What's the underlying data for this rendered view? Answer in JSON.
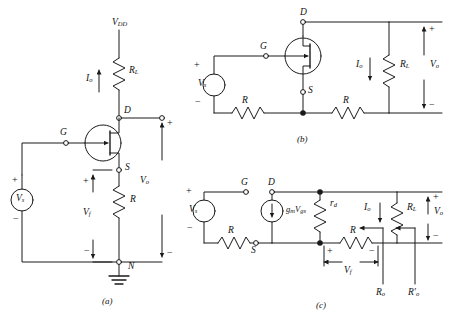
{
  "figure": {
    "background": "#ffffff",
    "stroke": "#1a1a1a",
    "panels": [
      {
        "key": "a",
        "label": "(a)",
        "caption": "common-drain amplifier with supply VDD"
      },
      {
        "key": "b",
        "label": "(b)",
        "caption": "redrawn circuit with load RL"
      },
      {
        "key": "c",
        "label": "(c)",
        "caption": "small-signal equivalent circuit"
      }
    ]
  },
  "panel_a": {
    "label": "(a)",
    "supply": "V",
    "supply_sub": "DD",
    "current": "I",
    "current_sub": "o",
    "load": "R",
    "load_sub": "L",
    "drain": "D",
    "gate": "G",
    "source": "S",
    "node": "N",
    "source_resistor": "R",
    "src_v": "V",
    "src_v_sub": "s",
    "vf": "V",
    "vf_sub": "f",
    "vo": "V",
    "vo_sub": "o",
    "plus": "+",
    "minus": "−",
    "ground": "ground-symbol"
  },
  "panel_b": {
    "label": "(b)",
    "drain": "D",
    "gate": "G",
    "source": "S",
    "src_v": "V",
    "src_v_sub": "s",
    "res_left": "R",
    "res_right": "R",
    "load": "R",
    "load_sub": "L",
    "current": "I",
    "current_sub": "o",
    "vo": "V",
    "vo_sub": "o",
    "plus": "+",
    "minus": "−"
  },
  "panel_c": {
    "label": "(c)",
    "gate": "G",
    "drain": "D",
    "source": "S",
    "src_v": "V",
    "src_v_sub": "s",
    "res_left": "R",
    "res_mid": "R",
    "vcvs": "g",
    "vcvs_sub1": "m",
    "vcvs_v": "V",
    "vcvs_sub2": "gs",
    "rd": "r",
    "rd_sub": "d",
    "load": "R",
    "load_sub": "L",
    "current": "I",
    "current_sub": "o",
    "vf": "V",
    "vf_sub": "f",
    "vo": "V",
    "vo_sub": "o",
    "ro": "R",
    "ro_sub": "o",
    "ro_prime": "R",
    "ro_prime_sub": "o",
    "ro_prime_mark": "′",
    "plus": "+",
    "minus": "−"
  }
}
